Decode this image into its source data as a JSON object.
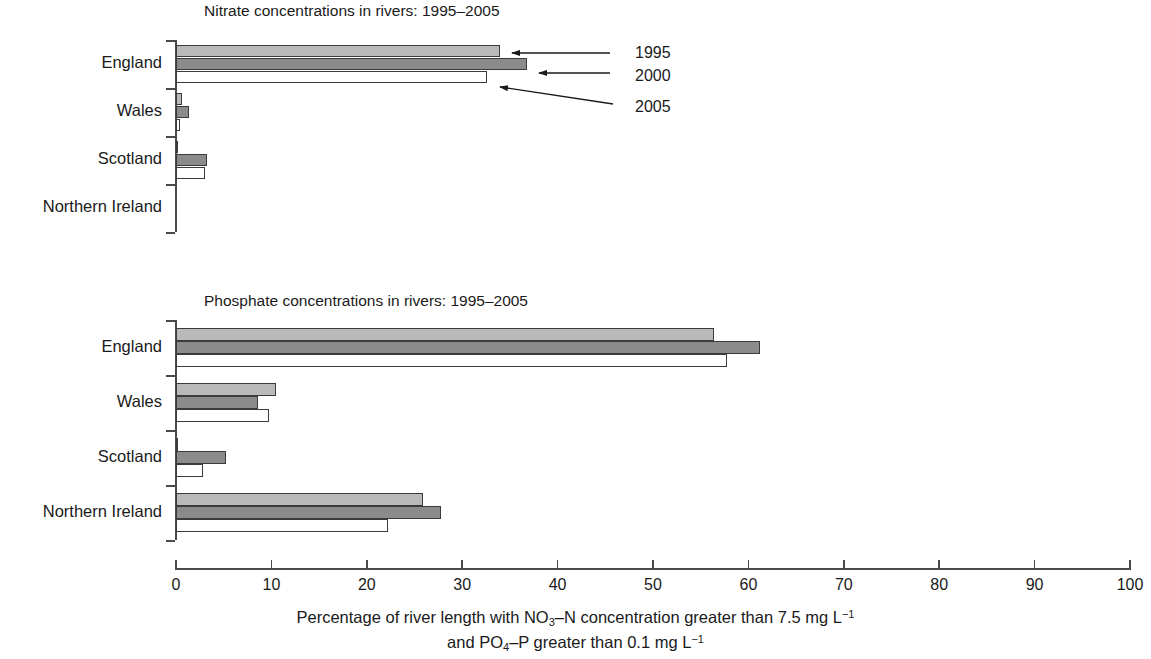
{
  "chart_data": {
    "type": "bar",
    "orientation": "horizontal",
    "xlabel_line1_parts": {
      "a": "Percentage of river length with NO",
      "sub1": "3",
      "b": "–N concentration greater than 7.5 mg L",
      "sup1": "−1"
    },
    "xlabel_line2_parts": {
      "a": "and PO",
      "sub1": "4",
      "b": "–P greater than 0.1 mg L",
      "sup1": "−1"
    },
    "xlabel_plain": "Percentage of river length with NO3–N concentration greater than 7.5 mg L−1 and PO4–P greater than 0.1 mg L−1",
    "xlim": [
      0,
      100
    ],
    "xticks": [
      0,
      10,
      20,
      30,
      40,
      50,
      60,
      70,
      80,
      90,
      100
    ],
    "categories": [
      "England",
      "Wales",
      "Scotland",
      "Northern Ireland"
    ],
    "legend": [
      "1995",
      "2000",
      "2005"
    ],
    "legend_position": "annotated arrows, upper right of top panel",
    "grid": false,
    "colors": {
      "1995": "#b9b9b9",
      "2000": "#8b8b8b",
      "2005": "#ffffff",
      "outline": "#3b3b3b",
      "axis": "#4a4a4a",
      "text": "#1a1a1a"
    },
    "panels": [
      {
        "id": "nitrate",
        "title": "Nitrate concentrations in rivers: 1995–2005",
        "categories": [
          "England",
          "Wales",
          "Scotland",
          "Northern Ireland"
        ],
        "series": [
          {
            "name": "1995",
            "values": [
              34.0,
              0.6,
              0.2,
              0.0
            ]
          },
          {
            "name": "2000",
            "values": [
              36.8,
              1.4,
              3.2,
              0.0
            ]
          },
          {
            "name": "2005",
            "values": [
              32.6,
              0.4,
              3.0,
              0.0
            ]
          }
        ]
      },
      {
        "id": "phosphate",
        "title": "Phosphate concentrations in rivers: 1995–2005",
        "categories": [
          "England",
          "Wales",
          "Scotland",
          "Northern Ireland"
        ],
        "series": [
          {
            "name": "1995",
            "values": [
              56.4,
              10.5,
              0.2,
              25.9
            ]
          },
          {
            "name": "2000",
            "values": [
              61.2,
              8.6,
              5.2,
              27.8
            ]
          },
          {
            "name": "2005",
            "values": [
              57.8,
              9.7,
              2.8,
              22.2
            ]
          }
        ]
      }
    ],
    "annotations": [
      {
        "label": "1995",
        "points_to": "England 1995 bar (top panel)"
      },
      {
        "label": "2000",
        "points_to": "England 2000 bar (top panel)"
      },
      {
        "label": "2005",
        "points_to": "England 2005 bar (top panel)"
      }
    ]
  }
}
